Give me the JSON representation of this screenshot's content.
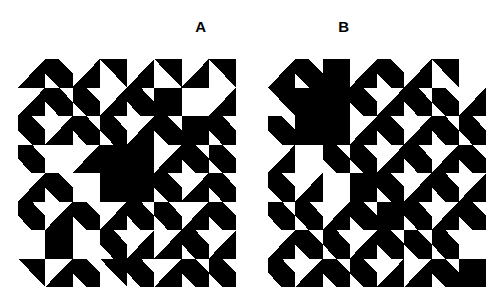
{
  "figure": {
    "background_color": "#ffffff",
    "ink_color": "#000000",
    "panel_count": 2,
    "grid_rows": 8,
    "grid_cols": 8,
    "tile_width": 27.25,
    "tile_height": 28.5
  },
  "labels": {
    "panel_a": "A",
    "panel_b": "B"
  },
  "tile_legend": {
    "W": "white-blank",
    "K": "black-solid",
    "NW": "triangle-upper-left-black",
    "NE": "triangle-upper-right-black",
    "SW": "triangle-lower-left-black",
    "SE": "triangle-lower-right-black",
    "DB": "diagonal-band-backslash-black",
    "DF": "diagonal-band-slash-black",
    "KNW": "black-with-white-upper-left-triangle",
    "KNE": "black-with-white-upper-right-triangle",
    "KSW": "black-with-white-lower-left-triangle",
    "KSE": "black-with-white-lower-right-triangle"
  },
  "panels": [
    {
      "id": "panel-a",
      "label": "A",
      "tiles": [
        [
          "SE",
          "DB",
          "SE",
          "NE",
          "SE",
          "NE",
          "SE",
          "NE"
        ],
        [
          "SE",
          "DB",
          "DB",
          "SE",
          "DB",
          "K",
          "W",
          "SE"
        ],
        [
          "DB",
          "SE",
          "DB",
          "DB",
          "SE",
          "DB",
          "K",
          "DB"
        ],
        [
          "DB",
          "W",
          "SE",
          "K",
          "K",
          "SE",
          "DB",
          "DB"
        ],
        [
          "SE",
          "DB",
          "W",
          "K",
          "K",
          "DB",
          "SE",
          "DB"
        ],
        [
          "DB",
          "SE",
          "DB",
          "SE",
          "DB",
          "DB",
          "SE",
          "DB"
        ],
        [
          "W",
          "K",
          "W",
          "DB",
          "SE",
          "SE",
          "DB",
          "SE"
        ],
        [
          "NE",
          "SE",
          "DB",
          "NE",
          "DB",
          "SE",
          "DB",
          "DB"
        ]
      ]
    },
    {
      "id": "panel-b",
      "label": "B",
      "tiles": [
        [
          "SE",
          "DB",
          "K",
          "SE",
          "DB",
          "SE",
          "NE",
          "W"
        ],
        [
          "NE",
          "K",
          "K",
          "DB",
          "SE",
          "DB",
          "DB",
          "SE"
        ],
        [
          "DB",
          "K",
          "K",
          "SE",
          "DB",
          "SE",
          "DB",
          "DB"
        ],
        [
          "SE",
          "W",
          "DB",
          "DB",
          "SE",
          "DB",
          "SE",
          "DB"
        ],
        [
          "DB",
          "SE",
          "W",
          "K",
          "DB",
          "SE",
          "DB",
          "SE"
        ],
        [
          "DB",
          "DB",
          "SE",
          "DB",
          "K",
          "DB",
          "SE",
          "DB"
        ],
        [
          "SE",
          "DB",
          "DB",
          "SE",
          "DB",
          "DB",
          "DB",
          "W"
        ],
        [
          "DB",
          "SE",
          "DB",
          "DB",
          "SE",
          "SE",
          "DB",
          "K"
        ]
      ]
    }
  ]
}
